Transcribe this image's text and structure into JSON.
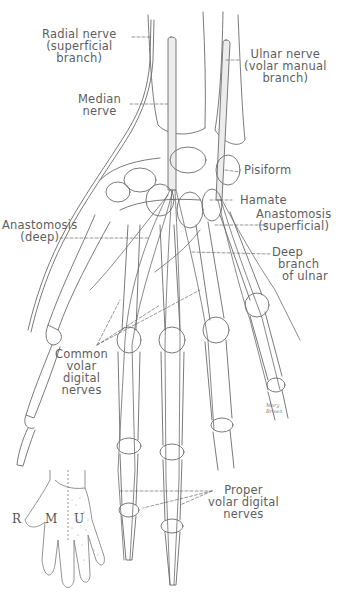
{
  "figure": {
    "labels": {
      "radial_nerve": [
        "Radial nerve",
        "(superficial",
        "branch)"
      ],
      "median_nerve": [
        "Median",
        "nerve"
      ],
      "ulnar_nerve": [
        "Ulnar nerve",
        "(volar manual",
        "branch)"
      ],
      "pisiform": [
        "Pisiform"
      ],
      "hamate": [
        "Hamate"
      ],
      "anastomosis_superficial": [
        "Anastomosis",
        "(superficial)"
      ],
      "anastomosis_deep": [
        "Anastomosis",
        "(deep)"
      ],
      "deep_branch_ulnar": [
        "Deep",
        "branch",
        "of ulnar"
      ],
      "common_volar_digital": [
        "Common",
        "volar",
        "digital",
        "nerves"
      ],
      "proper_volar_digital": [
        "Proper",
        "volar digital",
        "nerves"
      ]
    },
    "signature": [
      "Mary",
      "Brown"
    ],
    "inset": {
      "description": "Sensory distribution of the palm",
      "regions": [
        "R",
        "M",
        "U"
      ]
    },
    "colors": {
      "line": "#6b6b6b",
      "text": "#5e5e5e",
      "nerve_fill": "#e6e6e6",
      "background": "#ffffff"
    }
  }
}
